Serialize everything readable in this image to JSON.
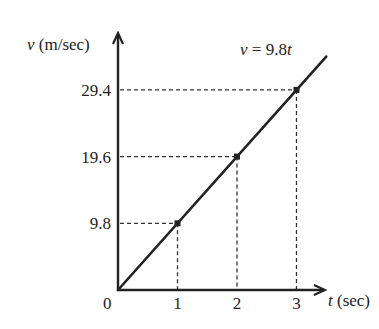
{
  "chart_data": {
    "type": "line",
    "title": "",
    "equation_label": {
      "var": "v",
      "eq": " = 9.8",
      "tvar": "t"
    },
    "xlabel": {
      "var": "t",
      "unit": " (sec)"
    },
    "ylabel": {
      "var": "v",
      "unit": " (m/sec)"
    },
    "origin_label": "0",
    "x_ticks": [
      "1",
      "2",
      "3"
    ],
    "y_ticks": [
      "9.8",
      "19.6",
      "29.4"
    ],
    "x": [
      0,
      1,
      2,
      3
    ],
    "series": [
      {
        "name": "v = 9.8t",
        "values": [
          0,
          9.8,
          19.6,
          29.4
        ]
      }
    ],
    "marked_points": [
      {
        "t": 1,
        "v": 9.8
      },
      {
        "t": 2,
        "v": 19.6
      },
      {
        "t": 3,
        "v": 29.4
      }
    ],
    "xlim": [
      0,
      3.5
    ],
    "ylim": [
      0,
      38
    ],
    "grid": false,
    "guides": "dashed projection lines from marked points to both axes",
    "legend": "none",
    "colors": {
      "line": "#222222",
      "axis": "#222222",
      "guide": "#333333"
    }
  }
}
